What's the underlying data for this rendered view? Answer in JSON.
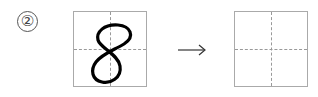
{
  "exercise": {
    "number_label": "②",
    "source_character": "8",
    "target_character": "",
    "arrow_icon": "right-arrow-icon"
  }
}
